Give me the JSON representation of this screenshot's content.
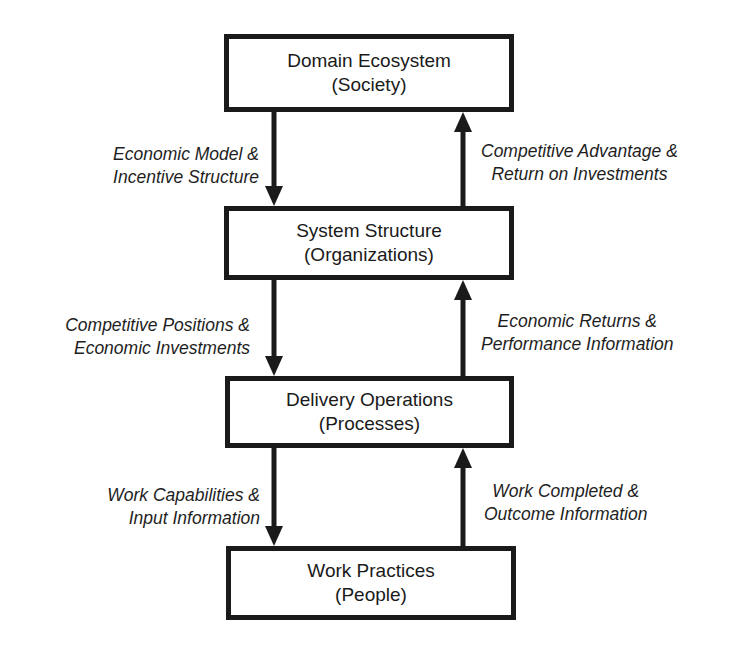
{
  "diagram": {
    "type": "layered-flow",
    "layers": [
      {
        "title": "Domain Ecosystem",
        "subtitle": "(Society)"
      },
      {
        "title": "System Structure",
        "subtitle": "(Organizations)"
      },
      {
        "title": "Delivery Operations",
        "subtitle": "(Processes)"
      },
      {
        "title": "Work Practices",
        "subtitle": "(People)"
      }
    ],
    "down_flows": [
      {
        "line1": "Economic Model &",
        "line2": "Incentive Structure"
      },
      {
        "line1": "Competitive Positions &",
        "line2": "Economic Investments"
      },
      {
        "line1": "Work Capabilities &",
        "line2": "Input Information"
      }
    ],
    "up_flows": [
      {
        "line1": "Competitive Advantage &",
        "line2": "Return on Investments"
      },
      {
        "line1": "Economic Returns &",
        "line2": "Performance Information"
      },
      {
        "line1": "Work Completed &",
        "line2": "Outcome Information"
      }
    ],
    "colors": {
      "stroke": "#1a1a1a",
      "background": "#ffffff"
    }
  }
}
